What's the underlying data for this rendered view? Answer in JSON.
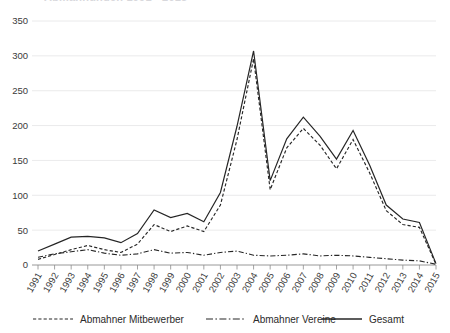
{
  "chart": {
    "title": "Abmahnungen 1991 - 2015",
    "title_visible": false
  },
  "legend": {
    "position": "bottom",
    "items": [
      {
        "label": "Abmahner Mitbewerber",
        "style": "dashed",
        "key": "mitbewerber"
      },
      {
        "label": "Abmahner Vereine",
        "style": "dash-dot",
        "key": "vereine"
      },
      {
        "label": "Gesamt",
        "style": "solid",
        "key": "gesamt"
      }
    ]
  },
  "axes": {
    "y_ticks": [
      "0",
      "50",
      "100",
      "150",
      "200",
      "250",
      "300",
      "350"
    ],
    "x_ticks": [
      "1991",
      "1992",
      "1993",
      "1994",
      "1995",
      "1996",
      "1997",
      "1998",
      "1999",
      "2000",
      "2001",
      "2002",
      "2003",
      "2004",
      "2005",
      "2006",
      "2007",
      "2008",
      "2009",
      "2010",
      "2011",
      "2012",
      "2013",
      "2014",
      "2015"
    ],
    "grid": true
  },
  "chart_data": {
    "type": "line",
    "title": "Abmahnungen 1991 - 2015",
    "xlabel": "",
    "ylabel": "",
    "ylim": [
      0,
      350
    ],
    "ytick_step": 50,
    "grid": true,
    "legend_position": "bottom",
    "categories": [
      "1991",
      "1992",
      "1993",
      "1994",
      "1995",
      "1996",
      "1997",
      "1998",
      "1999",
      "2000",
      "2001",
      "2002",
      "2003",
      "2004",
      "2005",
      "2006",
      "2007",
      "2008",
      "2009",
      "2010",
      "2011",
      "2012",
      "2013",
      "2014",
      "2015"
    ],
    "series": [
      {
        "name": "Abmahner Mitbewerber",
        "style": "dashed",
        "values": [
          8,
          15,
          22,
          28,
          22,
          18,
          30,
          58,
          48,
          56,
          48,
          86,
          180,
          296,
          108,
          168,
          196,
          172,
          138,
          180,
          132,
          78,
          58,
          54,
          1
        ]
      },
      {
        "name": "Abmahner Vereine",
        "style": "dash-dot",
        "values": [
          11,
          16,
          19,
          22,
          17,
          14,
          16,
          22,
          17,
          18,
          14,
          18,
          20,
          14,
          13,
          14,
          16,
          13,
          14,
          13,
          11,
          9,
          7,
          6,
          1
        ]
      },
      {
        "name": "Gesamt",
        "style": "solid",
        "values": [
          20,
          30,
          40,
          41,
          39,
          32,
          45,
          79,
          68,
          74,
          62,
          104,
          199,
          307,
          121,
          181,
          212,
          185,
          152,
          193,
          143,
          86,
          66,
          61,
          2
        ]
      }
    ]
  }
}
